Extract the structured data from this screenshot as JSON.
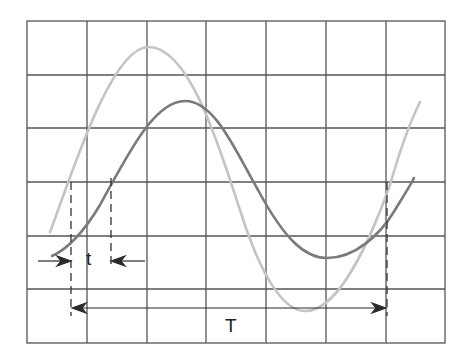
{
  "diagram": {
    "title": "",
    "grid": {
      "columns": 7,
      "rows": 6,
      "line_color": "#555555",
      "background": "#ffffff"
    },
    "waveforms": [
      {
        "name": "reference-wave",
        "color": "#c4c4c4",
        "amplitude_divs": 2.45,
        "description": "leading (light) waveform"
      },
      {
        "name": "delayed-wave",
        "color": "#7a7a7a",
        "amplitude_divs": 1.45,
        "description": "lagging (dark) waveform"
      }
    ],
    "annotations": {
      "phase_label": "t",
      "period_label": "T"
    },
    "colors": {
      "grid": "#555555",
      "light_wave": "#c4c4c4",
      "dark_wave": "#7a7a7a",
      "arrows": "#2a2a2a"
    }
  }
}
